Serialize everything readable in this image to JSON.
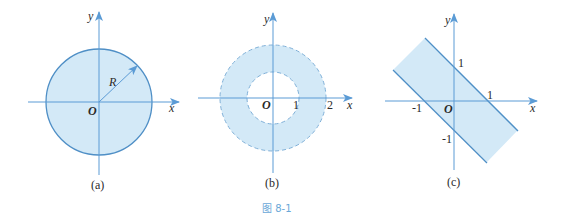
{
  "figure": {
    "caption": "图 8-1",
    "colors": {
      "axis": "#5b9bd5",
      "fill": "#d3e9f7",
      "boundary": "#4f8fc6",
      "text": "#2a2a2a",
      "caption": "#6aa8d8"
    },
    "panels": [
      {
        "id": "a",
        "sublabel": "(a)",
        "x_label": "x",
        "y_label": "y",
        "origin_label": "O",
        "radius_label": "R",
        "shape": "disk",
        "boundary": "solid"
      },
      {
        "id": "b",
        "sublabel": "(b)",
        "x_label": "x",
        "y_label": "y",
        "origin_label": "O",
        "tick_labels": [
          "1",
          "2"
        ],
        "shape": "annulus",
        "boundary": "dashed"
      },
      {
        "id": "c",
        "sublabel": "(c)",
        "x_label": "x",
        "y_label": "y",
        "origin_label": "O",
        "tick_labels": {
          "x_pos": "1",
          "x_neg": "-1",
          "y_pos": "1",
          "y_neg": "-1"
        },
        "shape": "strip between x+y=1 and x+y=-1",
        "boundary": "solid"
      }
    ]
  }
}
